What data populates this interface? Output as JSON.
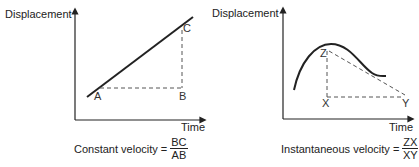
{
  "diagrams": [
    {
      "name": "constant-velocity",
      "y_axis_label": "Displacement",
      "x_axis_label": "Time",
      "points": {
        "a": "A",
        "b": "B",
        "c": "C"
      },
      "formula": {
        "lhs": "Constant velocity =",
        "numerator": "BC",
        "denominator": "AB"
      }
    },
    {
      "name": "instantaneous-velocity",
      "y_axis_label": "Displacement",
      "x_axis_label": "Time",
      "points": {
        "x": "X",
        "y": "Y",
        "z": "Z"
      },
      "formula": {
        "lhs": "Instantaneous velocity =",
        "numerator": "ZX",
        "denominator": "XY"
      }
    }
  ],
  "colors": {
    "line": "#222222",
    "dashed": "#555555",
    "background": "#ffffff"
  }
}
